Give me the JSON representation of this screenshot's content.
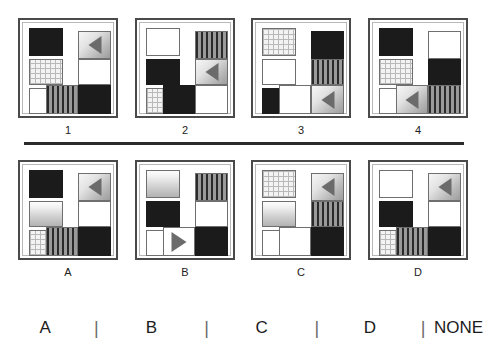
{
  "puzzle": {
    "type": "abstract-reasoning-matrix",
    "divider_color": "#2b2b2b",
    "frame_color": "#4a4a4a",
    "fills": {
      "white": "#ffffff",
      "black": "#1b1b1b",
      "stripe": "#8d8d8d",
      "dots": "#f3f3f3",
      "gradient": "#c9c9c9",
      "arrow_tile": "#b5b5b5",
      "arrow_glyph": "#6b6b6b"
    }
  },
  "problem_row": {
    "panels": [
      {
        "label": "1",
        "left_column": [
          "black",
          "dots",
          "white"
        ],
        "right_group": [
          "arrow-left",
          "white",
          "black"
        ],
        "extra_tile": "stripe"
      },
      {
        "label": "2",
        "left_column": [
          "white",
          "black",
          "dots"
        ],
        "right_group": [
          "stripe",
          "arrow-left",
          "white"
        ],
        "extra_tile": "black"
      },
      {
        "label": "3",
        "left_column": [
          "dots",
          "white",
          "black"
        ],
        "right_group": [
          "black",
          "stripe",
          "arrow-left"
        ],
        "extra_tile": "white"
      },
      {
        "label": "4",
        "left_column": [
          "black",
          "dots",
          "white"
        ],
        "right_group": [
          "white",
          "black",
          "stripe"
        ],
        "extra_tile": "arrow-left"
      }
    ]
  },
  "options_row": {
    "panels": [
      {
        "label": "A",
        "left_column": [
          "black",
          "gradient",
          "dots"
        ],
        "right_group": [
          "arrow-left",
          "white",
          "black"
        ],
        "extra_tile": "stripe"
      },
      {
        "label": "B",
        "left_column": [
          "gradient",
          "black",
          "white"
        ],
        "right_group": [
          "stripe",
          "white",
          "black"
        ],
        "extra_tile": "arrow-right-plain"
      },
      {
        "label": "C",
        "left_column": [
          "dots",
          "gradient",
          "white"
        ],
        "right_group": [
          "arrow-left",
          "stripe",
          "black"
        ],
        "extra_tile": "white"
      },
      {
        "label": "D",
        "left_column": [
          "white",
          "black",
          "dots"
        ],
        "right_group": [
          "arrow-left",
          "white",
          "black"
        ],
        "extra_tile": "stripe"
      }
    ]
  },
  "answer_bar": {
    "options": [
      "A",
      "B",
      "C",
      "D",
      "NONE"
    ],
    "separator": "|"
  }
}
